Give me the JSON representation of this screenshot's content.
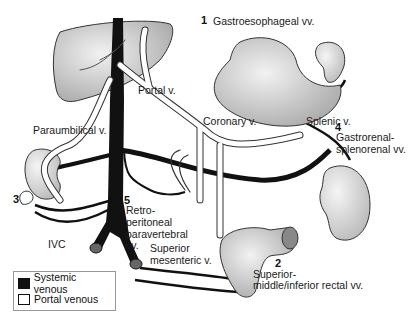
{
  "diagram": {
    "labels": {
      "portal_v": "Portal v.",
      "paraumbilical_v": "Paraumbilical v.",
      "coronary_v": "Coronary v.",
      "splenic_v": "Splenic v.",
      "ivc": "IVC",
      "superior_mesenteric_line1": "Superior",
      "superior_mesenteric_line2": "mesenteric v."
    },
    "anastomoses": [
      {
        "number": "1",
        "lines": [
          "Gastroesophageal vv."
        ]
      },
      {
        "number": "2",
        "lines": [
          "Superior-",
          "middle/inferior rectal vv."
        ]
      },
      {
        "number": "3",
        "lines": []
      },
      {
        "number": "4",
        "lines": [
          "Gastrorenal-",
          "splenorenal vv."
        ]
      },
      {
        "number": "5",
        "lines": [
          "Retro-",
          "peritoneal",
          "paravertebral",
          "vv."
        ]
      }
    ],
    "legend": {
      "items": [
        {
          "label": "Systemic venous",
          "color": "#111111"
        },
        {
          "label": "Portal venous",
          "color": "#ffffff"
        }
      ]
    },
    "colors": {
      "systemic": "#111111",
      "portal_fill": "#ffffff",
      "organ_fill": "#c9c9c9",
      "outline": "#333333"
    }
  }
}
